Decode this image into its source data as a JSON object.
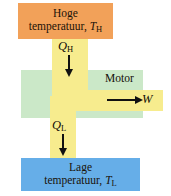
{
  "diagram": {
    "language": "nl",
    "hot_reservoir": {
      "line1": "Hoge",
      "line2_text": "temperatuur,",
      "symbol": "T",
      "subscript": "H",
      "color": "#f2a159"
    },
    "cold_reservoir": {
      "line1": "Lage",
      "line2_text": "temperatuur,",
      "symbol": "T",
      "subscript": "L",
      "color": "#66aee8"
    },
    "engine": {
      "label": "Motor",
      "color": "#cbe8c8"
    },
    "pipe": {
      "color": "#f7ec8e"
    },
    "flows": {
      "heat_in": {
        "symbol": "Q",
        "subscript": "H",
        "direction": "down",
        "arrow_icon": "arrow-down-icon"
      },
      "heat_out": {
        "symbol": "Q",
        "subscript": "L",
        "direction": "down",
        "arrow_icon": "arrow-down-icon"
      },
      "work_out": {
        "symbol": "W",
        "subscript": "",
        "direction": "right",
        "arrow_icon": "arrow-right-icon"
      }
    }
  }
}
